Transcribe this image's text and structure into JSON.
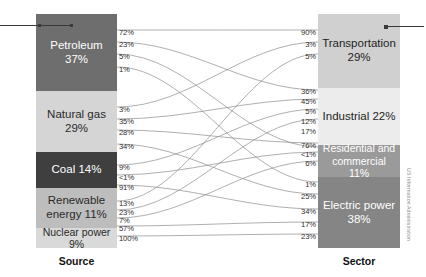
{
  "chart_data": {
    "type": "sankey",
    "title": "",
    "left_axis_label": "Source",
    "right_axis_label": "Sector",
    "credit": "US Information Administration",
    "nodes_left": [
      {
        "id": "petroleum",
        "label": "Petroleum 37%",
        "value": 37,
        "color": "#6e6e6e"
      },
      {
        "id": "natural_gas",
        "label": "Natural gas 29%",
        "value": 29,
        "color": "#d5d5d5"
      },
      {
        "id": "coal",
        "label": "Coal 14%",
        "value": 14,
        "color": "#3f3f3f"
      },
      {
        "id": "renewable",
        "label": "Renewable energy 11%",
        "value": 11,
        "color": "#bdbdbd"
      },
      {
        "id": "nuclear",
        "label": "Nuclear power 9%",
        "value": 9,
        "color": "#d9d9d9"
      }
    ],
    "nodes_right": [
      {
        "id": "transportation",
        "label": "Transportation 29%",
        "value": 29,
        "color": "#d0d0d0"
      },
      {
        "id": "industrial",
        "label": "Industrial 22%",
        "value": 22,
        "color": "#ececec"
      },
      {
        "id": "residential_commercial",
        "label": "Residential and commercial 11%",
        "value": 11,
        "color": "#9a9a9a"
      },
      {
        "id": "electric_power",
        "label": "Electric power 38%",
        "value": 38,
        "color": "#858585"
      }
    ],
    "source_outflow_labels": [
      {
        "source": "petroleum",
        "values": [
          "72%",
          "23%",
          "5%",
          "1%"
        ]
      },
      {
        "source": "natural_gas",
        "values": [
          "3%",
          "35%",
          "28%",
          "34%"
        ]
      },
      {
        "source": "coal",
        "values": [
          "9%",
          "<1%",
          "91%"
        ]
      },
      {
        "source": "renewable",
        "values": [
          "13%",
          "23%",
          "7%",
          "57%"
        ]
      },
      {
        "source": "nuclear",
        "values": [
          "100%"
        ]
      }
    ],
    "sector_inflow_labels": [
      {
        "sector": "transportation",
        "values": [
          "90%",
          "3%",
          "5%"
        ]
      },
      {
        "sector": "industrial",
        "values": [
          "36%",
          "45%",
          "5%",
          "12%",
          "17%"
        ]
      },
      {
        "sector": "residential_commercial",
        "values": [
          "76%",
          "<1%",
          "6%"
        ]
      },
      {
        "sector": "electric_power",
        "values": [
          "1%",
          "25%",
          "34%",
          "17%",
          "23%"
        ]
      }
    ],
    "flows": [
      {
        "source": "petroleum",
        "target": "transportation",
        "share_of_source": "72%",
        "share_of_sector": "90%"
      },
      {
        "source": "petroleum",
        "target": "industrial",
        "share_of_source": "23%",
        "share_of_sector": "36%"
      },
      {
        "source": "petroleum",
        "target": "residential_commercial",
        "share_of_source": "5%",
        "share_of_sector": "<1%"
      },
      {
        "source": "petroleum",
        "target": "electric_power",
        "share_of_source": "1%",
        "share_of_sector": "1%"
      },
      {
        "source": "natural_gas",
        "target": "transportation",
        "share_of_source": "3%",
        "share_of_sector": "3%"
      },
      {
        "source": "natural_gas",
        "target": "industrial",
        "share_of_source": "35%",
        "share_of_sector": "45%"
      },
      {
        "source": "natural_gas",
        "target": "residential_commercial",
        "share_of_source": "28%",
        "share_of_sector": "76%"
      },
      {
        "source": "natural_gas",
        "target": "electric_power",
        "share_of_source": "34%",
        "share_of_sector": "25%"
      },
      {
        "source": "coal",
        "target": "industrial",
        "share_of_source": "9%",
        "share_of_sector": "5%"
      },
      {
        "source": "coal",
        "target": "residential_commercial",
        "share_of_source": "<1%",
        "share_of_sector": "<1%"
      },
      {
        "source": "coal",
        "target": "electric_power",
        "share_of_source": "91%",
        "share_of_sector": "34%"
      },
      {
        "source": "renewable",
        "target": "transportation",
        "share_of_source": "13%",
        "share_of_sector": "5%"
      },
      {
        "source": "renewable",
        "target": "industrial",
        "share_of_source": "23%",
        "share_of_sector": "12%"
      },
      {
        "source": "renewable",
        "target": "residential_commercial",
        "share_of_source": "7%",
        "share_of_sector": "6%"
      },
      {
        "source": "renewable",
        "target": "electric_power",
        "share_of_source": "57%",
        "share_of_sector": "17%"
      },
      {
        "source": "nuclear",
        "target": "electric_power",
        "share_of_source": "100%",
        "share_of_sector": "23%"
      }
    ],
    "left_label_positions": [
      {
        "text": "72%",
        "top": 28
      },
      {
        "text": "23%",
        "top": 40
      },
      {
        "text": "5%",
        "top": 52
      },
      {
        "text": "1%",
        "top": 65
      },
      {
        "text": "3%",
        "top": 105
      },
      {
        "text": "35%",
        "top": 117
      },
      {
        "text": "28%",
        "top": 128
      },
      {
        "text": "34%",
        "top": 142
      },
      {
        "text": "9%",
        "top": 163
      },
      {
        "text": "<1%",
        "top": 173
      },
      {
        "text": "91%",
        "top": 183
      },
      {
        "text": "13%",
        "top": 199
      },
      {
        "text": "23%",
        "top": 208
      },
      {
        "text": "7%",
        "top": 216
      },
      {
        "text": "57%",
        "top": 224
      },
      {
        "text": "100%",
        "top": 234
      }
    ],
    "right_label_positions": [
      {
        "text": "90%",
        "top": 28
      },
      {
        "text": "3%",
        "top": 40
      },
      {
        "text": "5%",
        "top": 52
      },
      {
        "text": "36%",
        "top": 87
      },
      {
        "text": "45%",
        "top": 97
      },
      {
        "text": "5%",
        "top": 107
      },
      {
        "text": "12%",
        "top": 117
      },
      {
        "text": "17%",
        "top": 127
      },
      {
        "text": "76%",
        "top": 141
      },
      {
        "text": "<1%",
        "top": 150
      },
      {
        "text": "6%",
        "top": 159
      },
      {
        "text": "1%",
        "top": 180
      },
      {
        "text": "25%",
        "top": 192
      },
      {
        "text": "34%",
        "top": 207
      },
      {
        "text": "17%",
        "top": 220
      },
      {
        "text": "23%",
        "top": 232
      }
    ]
  },
  "axis": {
    "source": "Source",
    "sector": "Sector"
  },
  "credit": {
    "text": "US Information Administration"
  },
  "nodes": {
    "petroleum": "Petroleum 37%",
    "natural_gas": "Natural gas 29%",
    "coal": "Coal 14%",
    "renewable": "Renewable energy 11%",
    "nuclear": "Nuclear power 9%",
    "transportation": "Transportation 29%",
    "industrial": "Industrial 22%",
    "residential_commercial": "Residential and commercial 11%",
    "electric_power": "Electric power 38%"
  }
}
